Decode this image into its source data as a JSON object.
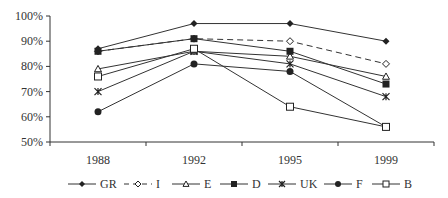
{
  "chart_data": {
    "type": "line",
    "title": "",
    "xlabel": "",
    "ylabel": "",
    "categories": [
      "1988",
      "1992",
      "1995",
      "1999"
    ],
    "ylim": [
      50,
      100
    ],
    "yticks": [
      "50%",
      "60%",
      "70%",
      "80%",
      "90%",
      "100%"
    ],
    "grid": false,
    "legend_position": "bottom",
    "series": [
      {
        "name": "GR",
        "values": [
          87,
          97,
          97,
          90
        ],
        "marker": "diamond-filled",
        "dash": false
      },
      {
        "name": "I",
        "values": [
          86,
          91,
          90,
          81
        ],
        "marker": "diamond-open",
        "dash": true
      },
      {
        "name": "E",
        "values": [
          79,
          86,
          84,
          76
        ],
        "marker": "triangle-open",
        "dash": false
      },
      {
        "name": "D",
        "values": [
          86,
          91,
          86,
          73
        ],
        "marker": "square-filled",
        "dash": false
      },
      {
        "name": "UK",
        "values": [
          70,
          86,
          81,
          68
        ],
        "marker": "star",
        "dash": false
      },
      {
        "name": "F",
        "values": [
          62,
          81,
          78,
          56
        ],
        "marker": "circle-filled",
        "dash": false
      },
      {
        "name": "B",
        "values": [
          76,
          87,
          64,
          56
        ],
        "marker": "square-open",
        "dash": false
      }
    ]
  }
}
